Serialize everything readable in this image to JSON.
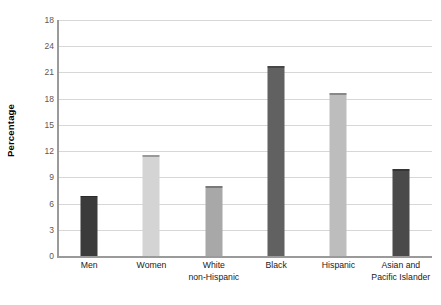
{
  "chart_data": {
    "type": "bar",
    "title": "",
    "subtitle": "",
    "xlabel": "",
    "ylabel": "Percentage",
    "ylim": [
      0,
      27
    ],
    "ytick_step": 3,
    "yticks": [
      "0",
      "3",
      "6",
      "9",
      "12",
      "15",
      "18",
      "21",
      "24",
      "18"
    ],
    "grid": true,
    "legend": "none",
    "categories": [
      "Men",
      "Women",
      "White non-Hispanic",
      "Black",
      "Hispanic",
      "Asian and Pacific Islander"
    ],
    "category_labels": [
      {
        "line1": "Men",
        "line2": ""
      },
      {
        "line1": "Women",
        "line2": ""
      },
      {
        "line1": "White",
        "line2": "non-Hispanic"
      },
      {
        "line1": "Black",
        "line2": ""
      },
      {
        "line1": "Hispanic",
        "line2": ""
      },
      {
        "line1": "Asian and",
        "line2": "Pacific Islander"
      }
    ],
    "values": [
      6.9,
      11.5,
      8.0,
      21.7,
      18.6,
      9.9
    ],
    "bar_colors": [
      "#3b3b3b",
      "#d4d4d4",
      "#a8a8a8",
      "#616161",
      "#bdbdbd",
      "#4a4a4a"
    ]
  },
  "style": {
    "background": "#ffffff",
    "gridline_color": "#d7d7d7",
    "axis_color": "#9a9a9a",
    "tick_text_color": "#595959",
    "label_text_color": "#1a1a1a"
  }
}
